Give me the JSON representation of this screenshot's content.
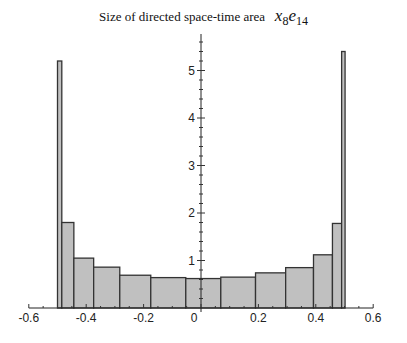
{
  "chart_data": {
    "type": "bar",
    "subtype": "histogram",
    "title": "Size of directed space-time area",
    "title_math": {
      "x": "x",
      "x_sub": "8",
      "e": "e",
      "e_sub": "14"
    },
    "xlabel": "",
    "ylabel": "",
    "xlim": [
      -0.6,
      0.6
    ],
    "ylim": [
      0,
      5.6
    ],
    "x_ticks": [
      -0.6,
      -0.4,
      -0.2,
      0,
      0.2,
      0.4,
      0.6
    ],
    "x_tick_labels": [
      "-0.6",
      "-0.4",
      "-0.2",
      "0",
      "0.2",
      "0.4",
      "0.6"
    ],
    "y_ticks": [
      1,
      2,
      3,
      4,
      5
    ],
    "y_tick_labels": [
      "1",
      "2",
      "3",
      "4",
      "5"
    ],
    "grid": false,
    "legend": null,
    "bar_fill": "#c0c0c0",
    "bar_stroke": "#333333",
    "bins": [
      {
        "x0": -0.5,
        "x1": -0.485,
        "value": 5.2
      },
      {
        "x0": -0.485,
        "x1": -0.443,
        "value": 1.8
      },
      {
        "x0": -0.443,
        "x1": -0.374,
        "value": 1.05
      },
      {
        "x0": -0.374,
        "x1": -0.283,
        "value": 0.86
      },
      {
        "x0": -0.283,
        "x1": -0.175,
        "value": 0.69
      },
      {
        "x0": -0.175,
        "x1": -0.053,
        "value": 0.64
      },
      {
        "x0": -0.053,
        "x1": 0.069,
        "value": 0.62
      },
      {
        "x0": 0.069,
        "x1": 0.19,
        "value": 0.65
      },
      {
        "x0": 0.19,
        "x1": 0.295,
        "value": 0.74
      },
      {
        "x0": 0.295,
        "x1": 0.392,
        "value": 0.85
      },
      {
        "x0": 0.392,
        "x1": 0.458,
        "value": 1.12
      },
      {
        "x0": 0.458,
        "x1": 0.49,
        "value": 1.78
      },
      {
        "x0": 0.49,
        "x1": 0.502,
        "value": 5.4
      }
    ]
  }
}
